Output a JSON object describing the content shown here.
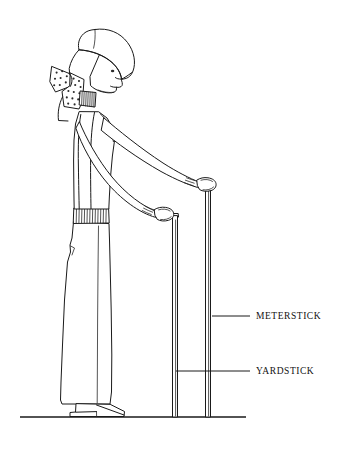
{
  "figure": {
    "background_color": "#ffffff",
    "ink_color": "#1a1a1a",
    "canvas": {
      "width": 351,
      "height": 450
    }
  },
  "labels": {
    "meterstick": "METERSTICK",
    "yardstick": "YARDSTICK"
  },
  "leaders": [
    {
      "name": "meterstick-leader",
      "x1": 212,
      "y1": 316,
      "x2": 250,
      "y2": 316
    },
    {
      "name": "yardstick-leader",
      "x1": 176,
      "y1": 371,
      "x2": 250,
      "y2": 371
    }
  ],
  "sticks": [
    {
      "name": "meterstick",
      "label": "METERSTICK",
      "top_y": 183,
      "bottom_y": 417,
      "left_x": 205,
      "right_x": 211,
      "taller": true
    },
    {
      "name": "yardstick",
      "label": "YARDSTICK",
      "top_y": 213,
      "bottom_y": 417,
      "left_x": 172,
      "right_x": 178,
      "taller": false
    }
  ],
  "ground": {
    "x1": 20,
    "x2": 246,
    "y": 417
  },
  "figure_parts": [
    "bonnet",
    "polka-dot-bow",
    "face-profile",
    "eye",
    "ribbed-collar",
    "torso-vest",
    "left-arm",
    "right-arm",
    "left-hand",
    "right-hand",
    "ribbed-waistband",
    "trousers",
    "shoe"
  ]
}
